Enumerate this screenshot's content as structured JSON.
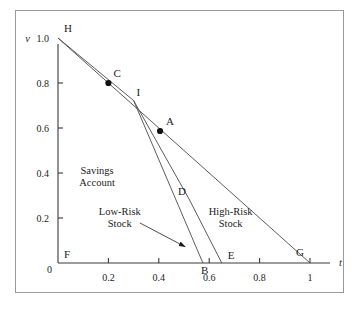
{
  "chart_data": {
    "type": "line",
    "title": "",
    "xlabel": "t",
    "ylabel": "v",
    "xlim": [
      0,
      1.08
    ],
    "ylim": [
      0,
      1.05
    ],
    "grid": false,
    "legend": "none",
    "x_ticks": [
      {
        "value": 0.2,
        "label": "0.2"
      },
      {
        "value": 0.4,
        "label": "0.4"
      },
      {
        "value": 0.6,
        "label": "0.6"
      },
      {
        "value": 0.8,
        "label": "0.8"
      },
      {
        "value": 1.0,
        "label": "1"
      }
    ],
    "y_ticks": [
      {
        "value": 0.2,
        "label": "0.2"
      },
      {
        "value": 0.4,
        "label": "0.4"
      },
      {
        "value": 0.6,
        "label": "0.6"
      },
      {
        "value": 0.8,
        "label": "0.8"
      },
      {
        "value": 1.0,
        "label": "1.0"
      }
    ],
    "origin_label": "0",
    "y_axis_name": "v",
    "x_axis_name": "t",
    "series": [
      {
        "name": "High-Risk Stock frontier",
        "points": [
          [
            0.0,
            1.0
          ],
          [
            1.0,
            0.0
          ]
        ]
      },
      {
        "name": "Savings Account / Low-Risk upper segment",
        "points": [
          [
            0.0,
            1.0
          ],
          [
            0.3,
            0.7222
          ]
        ]
      },
      {
        "name": "Low-Risk Stock branch",
        "points": [
          [
            0.3,
            0.7222
          ],
          [
            0.575,
            0.0
          ]
        ]
      },
      {
        "name": "Mid branch through D",
        "points": [
          [
            0.3,
            0.7222
          ],
          [
            0.52,
            0.2844
          ],
          [
            0.65,
            0.0
          ]
        ]
      }
    ],
    "labeled_points": [
      {
        "label": "H",
        "t": 0.0,
        "v": 1.0,
        "marker": false,
        "dx": 6,
        "dy": -6
      },
      {
        "label": "C",
        "t": 0.2,
        "v": 0.8,
        "marker": true,
        "dx": 5,
        "dy": -6
      },
      {
        "label": "I",
        "t": 0.3,
        "v": 0.7222,
        "marker": false,
        "dx": 3,
        "dy": -5
      },
      {
        "label": "A",
        "t": 0.405,
        "v": 0.5867,
        "marker": true,
        "dx": 6,
        "dy": -6
      },
      {
        "label": "D",
        "t": 0.52,
        "v": 0.2844,
        "marker": false,
        "dx": -11,
        "dy": -4
      },
      {
        "label": "F",
        "t": 0.0,
        "v": 0.0,
        "marker": false,
        "dx": 6,
        "dy": -5
      },
      {
        "label": "B",
        "t": 0.575,
        "v": 0.0,
        "marker": false,
        "dx": -2,
        "dy": 11
      },
      {
        "label": "E",
        "t": 0.65,
        "v": 0.0,
        "marker": false,
        "dx": 6,
        "dy": -4
      },
      {
        "label": "G",
        "t": 1.0,
        "v": 0.0,
        "marker": false,
        "dx": -14,
        "dy": -7
      }
    ],
    "annotations": [
      {
        "name": "savings-account",
        "lines": [
          "Savings",
          "Account"
        ],
        "t": 0.155,
        "v": 0.395,
        "anchor": "middle",
        "leader": null
      },
      {
        "name": "low-risk-stock",
        "lines": [
          "Low-Risk",
          "Stock"
        ],
        "t": 0.245,
        "v": 0.215,
        "anchor": "middle",
        "leader": {
          "from_t": 0.325,
          "from_v": 0.178,
          "to_t": 0.505,
          "to_v": 0.072,
          "arrow": true
        }
      },
      {
        "name": "high-risk-stock",
        "lines": [
          "High-Risk",
          "Stock"
        ],
        "t": 0.685,
        "v": 0.215,
        "anchor": "middle",
        "leader": null
      }
    ]
  },
  "colors": {
    "frame": "#9a9a9a",
    "axis": "#3a3a3a",
    "curve": "#4a4a4a",
    "marker": "#111111",
    "text": "#1c1c1c",
    "background": "#ffffff"
  }
}
